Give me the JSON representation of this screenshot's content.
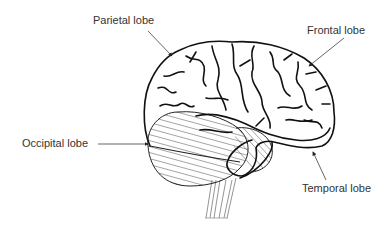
{
  "diagram": {
    "labels": [
      {
        "id": "parietal",
        "text": "Parietal lobe"
      },
      {
        "id": "frontal",
        "text": "Frontal lobe"
      },
      {
        "id": "occipital",
        "text": "Occipital lobe"
      },
      {
        "id": "temporal",
        "text": "Temporal lobe"
      }
    ],
    "colors": {
      "line": "#111111",
      "label": "#333333",
      "hatch": "#555555",
      "background": "#ffffff"
    }
  }
}
